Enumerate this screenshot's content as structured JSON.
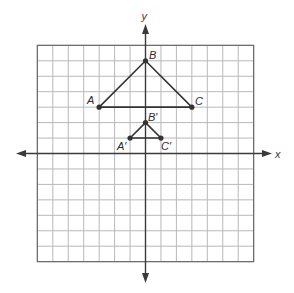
{
  "diagram": {
    "type": "coordinate-plane-dilation",
    "grid": {
      "x_min": -7,
      "x_max": 7,
      "y_min": -7,
      "y_max": 7,
      "step": 1,
      "line_color": "#b8b8b8",
      "border_color": "#6a6a6a"
    },
    "axes": {
      "x_label": "x",
      "y_label": "y",
      "color": "#3a3a3a"
    },
    "figures": [
      {
        "name": "triangle-ABC",
        "color": "#333333",
        "points": [
          {
            "label": "A",
            "x": -3,
            "y": 3
          },
          {
            "label": "B",
            "x": 0,
            "y": 6
          },
          {
            "label": "C",
            "x": 3,
            "y": 3
          }
        ]
      },
      {
        "name": "triangle-A'B'C'",
        "color": "#333333",
        "points": [
          {
            "label": "A′",
            "x": -1,
            "y": 1
          },
          {
            "label": "B′",
            "x": 0,
            "y": 2
          },
          {
            "label": "C′",
            "x": 1,
            "y": 1
          }
        ]
      }
    ]
  },
  "labels": {
    "x_axis": "x",
    "y_axis": "y",
    "A": "A",
    "B": "B",
    "C": "C",
    "A_prime": "A′",
    "B_prime": "B′",
    "C_prime": "C′"
  }
}
